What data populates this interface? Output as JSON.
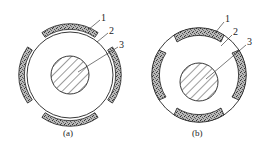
{
  "figures": [
    {
      "id": "a",
      "caption": "(a)",
      "labels": [
        "1",
        "2",
        "3"
      ]
    },
    {
      "id": "b",
      "caption": "(b)",
      "labels": [
        "1",
        "2",
        "3"
      ]
    }
  ],
  "colors": {
    "stroke": "#222222",
    "fill": "#ffffff",
    "segment_fill": "#9a9a9a"
  }
}
